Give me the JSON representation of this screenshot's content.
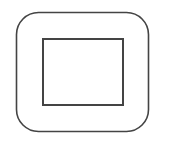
{
  "icon": {
    "semantic": "stop-icon",
    "stroke_color": "#444444",
    "background": "#ffffff",
    "outer_frame": {
      "x": 16.5,
      "y": 12.5,
      "width": 132,
      "height": 119,
      "radius": 22,
      "stroke_width": 1.6
    },
    "inner_square": {
      "x": 43,
      "y": 39,
      "width": 80,
      "height": 66,
      "stroke_width": 2
    }
  }
}
